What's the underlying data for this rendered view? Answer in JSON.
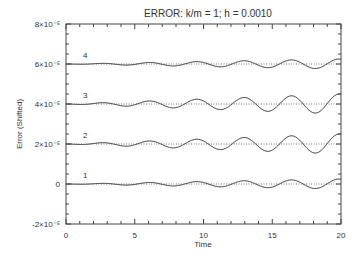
{
  "chart_data": {
    "type": "line",
    "title": "ERROR:  k/m = 1;  h = 0.0010",
    "xlabel": "Time",
    "ylabel": "Error (Shifted)",
    "xlim": [
      0,
      20
    ],
    "ylim": [
      -2e-05,
      8e-05
    ],
    "x_ticks": [
      0,
      5,
      10,
      15,
      20
    ],
    "x_tick_labels": [
      "0",
      "5",
      "10",
      "15",
      "20"
    ],
    "y_ticks": [
      -2e-05,
      0,
      2e-05,
      4e-05,
      6e-05,
      8e-05
    ],
    "y_tick_labels": [
      "-2×10⁻⁵",
      "0",
      "2×10⁻⁵",
      "4×10⁻⁵",
      "6×10⁻⁵",
      "8×10⁻⁵"
    ],
    "grid": false,
    "legend": "none (curves labelled inline 1–4)",
    "series": [
      {
        "name": "1",
        "baseline": 0,
        "period": 3.45,
        "amplitude_growth_per_time": 1.2e-09,
        "max_amplitude": 2.5e-06
      },
      {
        "name": "2",
        "baseline": 2e-05,
        "period": 3.45,
        "amplitude_growth_per_time": 1.8e-09,
        "max_amplitude": 5e-06
      },
      {
        "name": "3",
        "baseline": 4e-05,
        "period": 3.45,
        "amplitude_growth_per_time": 2.5e-09,
        "max_amplitude": 5e-06
      },
      {
        "name": "4",
        "baseline": 6e-05,
        "period": 3.45,
        "amplitude_growth_per_time": 1.2e-09,
        "max_amplitude": 2.5e-06
      }
    ]
  }
}
